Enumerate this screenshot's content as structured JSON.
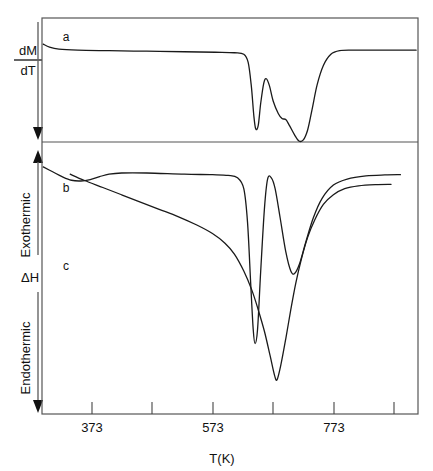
{
  "figure": {
    "type": "scientific-plot",
    "background_color": "#ffffff",
    "line_color": "#1a1a1a",
    "frame_color": "#555555"
  },
  "axes": {
    "x_title": "T(K)",
    "x_tick_labels": [
      "373",
      "573",
      "773"
    ],
    "x_range": [
      273,
      873
    ],
    "x_major_ticks": [
      373,
      573,
      773
    ],
    "x_minor_ticks": [
      473,
      673,
      873
    ],
    "left_axis": {
      "top_label_numerator": "dM",
      "top_label_denominator": "dT",
      "exothermic_label": "Exothermic",
      "delta_h_label": "ΔH",
      "endothermic_label": "Endothermic"
    }
  },
  "panels": [
    {
      "id": "panel-a",
      "curve_label": "a",
      "quantity": "dM/dT"
    },
    {
      "id": "panel-bc",
      "curve_labels": [
        "b",
        "c"
      ],
      "quantity": "ΔH"
    }
  ],
  "chart_data": {
    "type": "line",
    "title": "",
    "xlabel": "T(K)",
    "ylabel": "dM/dT and ΔH (Exothermic up / Endothermic down)",
    "xlim": [
      273,
      873
    ],
    "grid": false,
    "legend": "inline curve labels a, b, c",
    "xticks": [
      373,
      573,
      773
    ],
    "xtick_labels": [
      "373",
      "573",
      "773"
    ],
    "minor_xticks": [
      473,
      673,
      873
    ],
    "annotations": [
      {
        "text": "a",
        "x": 310,
        "note": "TG derivative curve, upper panel"
      },
      {
        "text": "b",
        "x": 310,
        "note": "DTA curve with sharp double endotherm"
      },
      {
        "text": "c",
        "x": 310,
        "note": "DTA curve with single broad endotherm"
      },
      {
        "text": "dM/dT",
        "note": "upper panel ordinate, arrow pointing down"
      },
      {
        "text": "ΔH",
        "note": "lower panel ordinate"
      },
      {
        "text": "Exothermic",
        "note": "upward arrow direction"
      },
      {
        "text": "Endothermic",
        "note": "downward arrow direction"
      }
    ],
    "series": [
      {
        "name": "a",
        "panel": "upper",
        "description": "Flat baseline then sharp endothermic dip at ~610 K, partial recovery peak at ~630 K, shallow dip ~655 K, deep dip ~685 K, then recovery to baseline",
        "points": [
          [
            275,
            0.96
          ],
          [
            285,
            0.93
          ],
          [
            300,
            0.91
          ],
          [
            330,
            0.9
          ],
          [
            380,
            0.895
          ],
          [
            440,
            0.89
          ],
          [
            500,
            0.885
          ],
          [
            550,
            0.88
          ],
          [
            580,
            0.875
          ],
          [
            595,
            0.86
          ],
          [
            602,
            0.78
          ],
          [
            607,
            0.55
          ],
          [
            611,
            0.26
          ],
          [
            614,
            0.13
          ],
          [
            618,
            0.16
          ],
          [
            622,
            0.38
          ],
          [
            627,
            0.58
          ],
          [
            631,
            0.62
          ],
          [
            636,
            0.55
          ],
          [
            642,
            0.4
          ],
          [
            650,
            0.28
          ],
          [
            656,
            0.23
          ],
          [
            662,
            0.22
          ],
          [
            668,
            0.16
          ],
          [
            676,
            0.07
          ],
          [
            683,
            0.01
          ],
          [
            690,
            0.02
          ],
          [
            697,
            0.12
          ],
          [
            704,
            0.32
          ],
          [
            712,
            0.56
          ],
          [
            722,
            0.75
          ],
          [
            734,
            0.86
          ],
          [
            748,
            0.895
          ],
          [
            770,
            0.9
          ],
          [
            810,
            0.9
          ],
          [
            870,
            0.9
          ]
        ]
      },
      {
        "name": "b",
        "panel": "lower",
        "description": "Baseline with slight broad dip near 330 K, very deep sharp endotherm at ~608 K, recovery peak at ~633 K, second endotherm at ~672 K, gradual return to baseline",
        "points": [
          [
            275,
            0.93
          ],
          [
            290,
            0.91
          ],
          [
            305,
            0.89
          ],
          [
            320,
            0.875
          ],
          [
            335,
            0.872
          ],
          [
            350,
            0.878
          ],
          [
            365,
            0.89
          ],
          [
            380,
            0.9
          ],
          [
            400,
            0.905
          ],
          [
            440,
            0.905
          ],
          [
            500,
            0.9
          ],
          [
            545,
            0.898
          ],
          [
            570,
            0.895
          ],
          [
            585,
            0.885
          ],
          [
            595,
            0.84
          ],
          [
            601,
            0.7
          ],
          [
            606,
            0.45
          ],
          [
            610,
            0.26
          ],
          [
            613,
            0.2
          ],
          [
            617,
            0.26
          ],
          [
            622,
            0.5
          ],
          [
            628,
            0.76
          ],
          [
            633,
            0.88
          ],
          [
            639,
            0.885
          ],
          [
            645,
            0.84
          ],
          [
            653,
            0.72
          ],
          [
            662,
            0.58
          ],
          [
            670,
            0.5
          ],
          [
            676,
            0.49
          ],
          [
            684,
            0.53
          ],
          [
            694,
            0.62
          ],
          [
            706,
            0.72
          ],
          [
            720,
            0.8
          ],
          [
            738,
            0.855
          ],
          [
            760,
            0.88
          ],
          [
            790,
            0.893
          ],
          [
            820,
            0.897
          ],
          [
            845,
            0.898
          ]
        ]
      },
      {
        "name": "c",
        "panel": "lower",
        "description": "Broad gradual decline from 320 K, steep V-shaped endotherm minimum at ~645 K, then steep recovery levelling off by 790 K",
        "points": [
          [
            318,
            0.9
          ],
          [
            340,
            0.875
          ],
          [
            370,
            0.845
          ],
          [
            400,
            0.815
          ],
          [
            430,
            0.785
          ],
          [
            460,
            0.755
          ],
          [
            490,
            0.725
          ],
          [
            520,
            0.69
          ],
          [
            545,
            0.655
          ],
          [
            565,
            0.615
          ],
          [
            580,
            0.57
          ],
          [
            595,
            0.5
          ],
          [
            608,
            0.42
          ],
          [
            618,
            0.34
          ],
          [
            628,
            0.25
          ],
          [
            637,
            0.15
          ],
          [
            644,
            0.07
          ],
          [
            648,
            0.05
          ],
          [
            654,
            0.11
          ],
          [
            662,
            0.22
          ],
          [
            670,
            0.34
          ],
          [
            678,
            0.45
          ],
          [
            687,
            0.55
          ],
          [
            697,
            0.64
          ],
          [
            708,
            0.71
          ],
          [
            722,
            0.775
          ],
          [
            738,
            0.815
          ],
          [
            756,
            0.84
          ],
          [
            778,
            0.852
          ],
          [
            805,
            0.857
          ],
          [
            830,
            0.858
          ]
        ]
      }
    ]
  }
}
